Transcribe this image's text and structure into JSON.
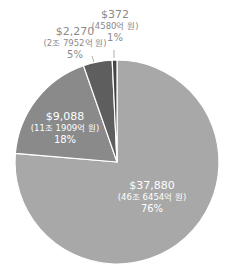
{
  "chart_data": {
    "type": "pie",
    "title": "",
    "start_angle_deg": 0,
    "direction": "clockwise",
    "slices": [
      {
        "label": "$37,880",
        "sublabel": "(46조 6454억 원)",
        "percent_label": "76%",
        "value": 37880,
        "percent": 76,
        "color": "#a8a8a8"
      },
      {
        "label": "$9,088",
        "sublabel": "(11조 1909억 원)",
        "percent_label": "18%",
        "value": 9088,
        "percent": 18,
        "color": "#8a8a8a"
      },
      {
        "label": "$2,270",
        "sublabel": "(2조 7952억 원)",
        "percent_label": "5%",
        "value": 2270,
        "percent": 5,
        "color": "#5e5e5e"
      },
      {
        "label": "$372",
        "sublabel": "(4580억 원)",
        "percent_label": "1%",
        "value": 372,
        "percent": 1,
        "color": "#454545"
      }
    ],
    "legend": "none"
  },
  "labels": {
    "s0": {
      "value": "$37,880",
      "sub": "(46조 6454억 원)",
      "pct": "76%"
    },
    "s1": {
      "value": "$9,088",
      "sub": "(11조 1909억 원)",
      "pct": "18%"
    },
    "s2": {
      "value": "$2,270",
      "sub": "(2조 7952억 원)",
      "pct": "5%"
    },
    "s3": {
      "value": "$372",
      "sub": "(4580억 원)",
      "pct": "1%"
    }
  }
}
